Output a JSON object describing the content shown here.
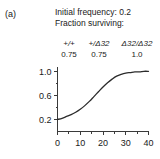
{
  "panel": {
    "label": "(a)"
  },
  "header": {
    "initial_frequency_line": "Initial frequency: 0.2",
    "fraction_surviving_line": "Fraction surviving:"
  },
  "genotype_table": {
    "headers": [
      "+/+",
      "+/Δ32",
      "Δ32/Δ32"
    ],
    "values": [
      "0.75",
      "0.75",
      "1.0"
    ]
  },
  "chart_data": {
    "type": "line",
    "title": "",
    "xlabel": "",
    "ylabel": "",
    "xlim": [
      0,
      40
    ],
    "ylim": [
      0.0,
      1.08
    ],
    "grid": false,
    "legend": null,
    "x_ticks": [
      0,
      10,
      20,
      30,
      40
    ],
    "x_tick_labels": [
      "0",
      "10",
      "20",
      "30",
      "40"
    ],
    "x_minor_ticks": [
      5,
      15,
      25,
      35
    ],
    "y_ticks": [
      0.2,
      0.6,
      1.0
    ],
    "y_tick_labels": [
      "0.2",
      "0.6",
      "1.0"
    ],
    "y_minor_ticks": [
      0.4,
      0.8
    ],
    "series": [
      {
        "name": "allele frequency",
        "color": "#2b2b2b",
        "x": [
          0,
          2,
          4,
          6,
          8,
          10,
          12,
          14,
          16,
          18,
          20,
          22,
          24,
          26,
          28,
          30,
          32,
          34,
          36,
          38,
          40
        ],
        "values": [
          0.2,
          0.22,
          0.25,
          0.28,
          0.32,
          0.37,
          0.43,
          0.5,
          0.58,
          0.66,
          0.74,
          0.81,
          0.87,
          0.92,
          0.95,
          0.97,
          0.98,
          0.99,
          0.99,
          1.0,
          1.0
        ]
      }
    ]
  }
}
